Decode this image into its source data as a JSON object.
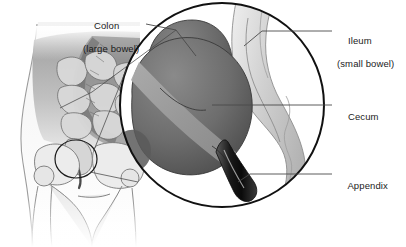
{
  "figure": {
    "type": "medical-illustration",
    "background_color": "#ffffff"
  },
  "labels": {
    "colon": {
      "line1": "Colon",
      "line2": "(large bowel)"
    },
    "ileum": {
      "line1": "Ileum",
      "line2": "(small bowel)"
    },
    "cecum": {
      "line1": "Cecum",
      "line2": ""
    },
    "appendix": {
      "line1": "Appendix",
      "line2": ""
    }
  },
  "colors": {
    "text": "#1b1b1b",
    "leader_line": "#4a4a4a",
    "magnifier_stroke": "#111111",
    "cecum_fill": "#6f6f6f",
    "cecum_shadow": "#4f4f4f",
    "taenia_band": "#9a9a9a",
    "ileum_fill": "#d8d8d8",
    "appendix_fill": "#141414",
    "body_outline": "#8e8e8e",
    "bowel_light": "#cfcfcf",
    "bone_fill": "#e2e2e2"
  },
  "magnifier": {
    "center_x": 222,
    "center_y": 105,
    "radius": 103,
    "stroke_width": 2
  },
  "callout_circle": {
    "center_x": 76,
    "center_y": 159,
    "radius_x": 21,
    "radius_y": 19
  },
  "structures": [
    {
      "name": "colon",
      "label_key": "colon"
    },
    {
      "name": "ileum",
      "label_key": "ileum"
    },
    {
      "name": "cecum",
      "label_key": "cecum"
    },
    {
      "name": "appendix",
      "label_key": "appendix"
    }
  ]
}
